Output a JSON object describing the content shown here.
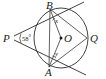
{
  "figure": {
    "type": "circle-geometry-diagram",
    "background_color": "#ffffff",
    "line_color": "#2b2b2b",
    "label_color": "#1a1a1a",
    "points": [
      {
        "id": "P",
        "label": "P",
        "x": 9,
        "y": 38,
        "role": "external-point"
      },
      {
        "id": "B",
        "label": "B",
        "x": 50,
        "y": 8,
        "role": "circle-point"
      },
      {
        "id": "A",
        "label": "A",
        "x": 49,
        "y": 68,
        "role": "circle-point"
      },
      {
        "id": "Q",
        "label": "Q",
        "x": 88,
        "y": 38,
        "role": "circle-point"
      },
      {
        "id": "O",
        "label": "O",
        "x": 62,
        "y": 38,
        "role": "centre"
      }
    ],
    "angles": [
      {
        "id": "P-angle",
        "label": "58",
        "degree_symbol": "°",
        "vertex": "P",
        "value": 58
      },
      {
        "id": "B-angle",
        "label": "x",
        "vertex": "B"
      },
      {
        "id": "A-angle",
        "label": "y",
        "vertex": "A"
      }
    ],
    "circle": {
      "cx": 61,
      "cy": 38,
      "r": 27
    },
    "segments": [
      {
        "from": "P",
        "to": "B",
        "kind": "tangent-line"
      },
      {
        "from": "P",
        "to": "A",
        "kind": "tangent-line"
      },
      {
        "from": "B",
        "to": "A",
        "kind": "chord"
      },
      {
        "from": "B",
        "to": "O",
        "kind": "radius"
      },
      {
        "from": "A",
        "to": "O",
        "kind": "radius"
      },
      {
        "from": "B",
        "to": "Q",
        "kind": "chord"
      },
      {
        "from": "A",
        "to": "Q",
        "kind": "chord"
      }
    ]
  }
}
